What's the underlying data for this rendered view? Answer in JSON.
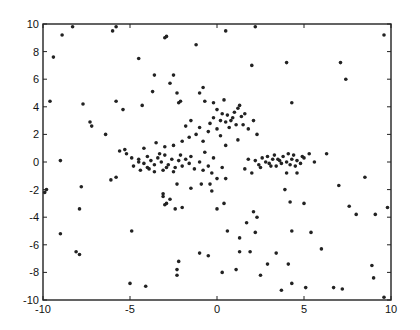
{
  "chart_data": {
    "type": "scatter",
    "title": "",
    "xlabel": "",
    "ylabel": "",
    "xlim": [
      -10,
      10
    ],
    "ylim": [
      -10,
      10
    ],
    "grid": false,
    "legend": null,
    "xticks": [
      -10,
      -5,
      0,
      5,
      10
    ],
    "yticks": [
      -10,
      -8,
      -6,
      -4,
      -2,
      0,
      2,
      4,
      6,
      8,
      10
    ],
    "xtick_labels": [
      "-10",
      "-5",
      "0",
      "5",
      "10"
    ],
    "ytick_labels": [
      "-10",
      "-8",
      "-6",
      "-4",
      "-2",
      "0",
      "2",
      "4",
      "6",
      "8",
      "10"
    ],
    "marker_color": "#222222",
    "series": [
      {
        "name": "points",
        "points": [
          [
            -8.9,
            9.2
          ],
          [
            -8.3,
            9.8
          ],
          [
            -5.8,
            9.8
          ],
          [
            -6.0,
            9.5
          ],
          [
            -3.0,
            9.0
          ],
          [
            -2.9,
            9.1
          ],
          [
            -1.2,
            8.5
          ],
          [
            2.2,
            9.8
          ],
          [
            9.6,
            9.2
          ],
          [
            -9.4,
            7.6
          ],
          [
            -4.5,
            7.5
          ],
          [
            -3.6,
            6.3
          ],
          [
            -2.7,
            5.7
          ],
          [
            -2.5,
            6.3
          ],
          [
            -2.3,
            5.0
          ],
          [
            -2.2,
            4.3
          ],
          [
            -2.1,
            4.4
          ],
          [
            -3.7,
            5.1
          ],
          [
            -4.3,
            4.1
          ],
          [
            -0.8,
            5.4
          ],
          [
            -0.7,
            4.4
          ],
          [
            0.5,
            9.5
          ],
          [
            2.0,
            7.0
          ],
          [
            4.0,
            7.2
          ],
          [
            7.1,
            7.2
          ],
          [
            7.4,
            6.0
          ],
          [
            4.3,
            4.3
          ],
          [
            -1.0,
            5.0
          ],
          [
            -9.6,
            4.4
          ],
          [
            -7.7,
            4.2
          ],
          [
            -5.8,
            4.4
          ],
          [
            -5.4,
            3.8
          ],
          [
            -7.3,
            2.9
          ],
          [
            -7.2,
            2.6
          ],
          [
            -6.4,
            2.0
          ],
          [
            -9.0,
            0.1
          ],
          [
            -9.8,
            -2.0
          ],
          [
            -9.9,
            -2.2
          ],
          [
            0.0,
            3.8
          ],
          [
            0.3,
            3.5
          ],
          [
            0.6,
            3.4
          ],
          [
            0.8,
            3.0
          ],
          [
            1.0,
            3.6
          ],
          [
            1.2,
            3.9
          ],
          [
            1.4,
            3.3
          ],
          [
            0.9,
            3.2
          ],
          [
            0.5,
            2.9
          ],
          [
            0.2,
            3.0
          ],
          [
            -0.2,
            3.2
          ],
          [
            -0.4,
            2.8
          ],
          [
            1.6,
            3.5
          ],
          [
            1.1,
            2.7
          ],
          [
            0.7,
            2.5
          ],
          [
            -0.5,
            2.2
          ],
          [
            -1.0,
            2.5
          ],
          [
            -1.2,
            2.0
          ],
          [
            -1.6,
            1.8
          ],
          [
            -2.0,
            1.5
          ],
          [
            -2.5,
            1.2
          ],
          [
            -3.0,
            1.1
          ],
          [
            -3.5,
            1.4
          ],
          [
            -4.2,
            1.0
          ],
          [
            -0.8,
            1.5
          ],
          [
            0.2,
            1.9
          ],
          [
            0.5,
            1.2
          ],
          [
            1.2,
            1.6
          ],
          [
            1.8,
            2.4
          ],
          [
            2.1,
            3.0
          ],
          [
            -0.2,
            4.3
          ],
          [
            0.4,
            4.5
          ],
          [
            1.3,
            4.1
          ],
          [
            2.3,
            2.0
          ],
          [
            -1.5,
            3.0
          ],
          [
            -1.8,
            2.6
          ],
          [
            1.5,
            2.7
          ],
          [
            0.0,
            2.4
          ],
          [
            -5.3,
            0.9
          ],
          [
            -5.2,
            0.6
          ],
          [
            -4.9,
            0.3
          ],
          [
            -4.8,
            -0.3
          ],
          [
            -4.5,
            0.2
          ],
          [
            -4.2,
            -0.1
          ],
          [
            -4.0,
            0.4
          ],
          [
            -3.8,
            0.1
          ],
          [
            -3.6,
            -0.2
          ],
          [
            -3.4,
            0.3
          ],
          [
            -3.2,
            0.0
          ],
          [
            -3.0,
            0.5
          ],
          [
            -2.8,
            -0.2
          ],
          [
            -2.6,
            0.2
          ],
          [
            -2.4,
            -0.4
          ],
          [
            -2.2,
            0.1
          ],
          [
            -2.0,
            -0.3
          ],
          [
            -1.8,
            0.2
          ],
          [
            -1.6,
            -0.1
          ],
          [
            -1.3,
            -0.5
          ],
          [
            -1.0,
            0.0
          ],
          [
            -0.8,
            -0.6
          ],
          [
            -0.5,
            -0.3
          ],
          [
            -0.3,
            -0.8
          ],
          [
            0.0,
            -1.2
          ],
          [
            -3.9,
            -0.5
          ],
          [
            -3.6,
            -0.7
          ],
          [
            -4.4,
            -0.6
          ],
          [
            -5.6,
            0.8
          ],
          [
            -3.1,
            -0.6
          ],
          [
            -2.9,
            -0.4
          ],
          [
            -2.5,
            -0.7
          ],
          [
            -4.0,
            -0.4
          ],
          [
            -3.3,
            0.6
          ],
          [
            -2.1,
            0.5
          ],
          [
            -1.5,
            0.4
          ],
          [
            -0.7,
            0.7
          ],
          [
            -0.2,
            0.3
          ],
          [
            0.3,
            -0.4
          ],
          [
            -6.1,
            -1.3
          ],
          [
            -5.8,
            -1.1
          ],
          [
            -2.3,
            -1.6
          ],
          [
            -1.5,
            -1.9
          ],
          [
            -0.9,
            -1.6
          ],
          [
            -0.4,
            -1.6
          ],
          [
            -3.1,
            -2.3
          ],
          [
            -2.9,
            -3.0
          ],
          [
            -2.7,
            -2.7
          ],
          [
            -2.0,
            -3.3
          ],
          [
            0.5,
            -1.2
          ],
          [
            -4.5,
            0.0
          ],
          [
            2.2,
            0.1
          ],
          [
            2.4,
            -0.2
          ],
          [
            2.6,
            0.3
          ],
          [
            2.8,
            0.0
          ],
          [
            3.0,
            -0.1
          ],
          [
            3.2,
            0.2
          ],
          [
            3.4,
            -0.3
          ],
          [
            3.6,
            0.1
          ],
          [
            3.8,
            0.4
          ],
          [
            4.0,
            0.0
          ],
          [
            4.2,
            -0.2
          ],
          [
            4.4,
            0.5
          ],
          [
            4.6,
            0.1
          ],
          [
            4.8,
            -0.1
          ],
          [
            5.0,
            0.3
          ],
          [
            2.5,
            -0.4
          ],
          [
            2.9,
            0.4
          ],
          [
            3.3,
            0.5
          ],
          [
            3.7,
            -0.1
          ],
          [
            4.1,
            0.6
          ],
          [
            4.5,
            -0.3
          ],
          [
            3.1,
            -0.3
          ],
          [
            3.5,
            0.2
          ],
          [
            4.3,
            0.2
          ],
          [
            4.9,
            0.4
          ],
          [
            1.8,
            0.2
          ],
          [
            1.6,
            -0.5
          ],
          [
            2.0,
            -0.8
          ],
          [
            5.3,
            0.6
          ],
          [
            5.6,
            0.0
          ],
          [
            6.3,
            0.6
          ],
          [
            4.0,
            -0.8
          ],
          [
            4.6,
            -0.8
          ],
          [
            8.5,
            -1.1
          ],
          [
            4.2,
            -2.9
          ],
          [
            5.0,
            -3.0
          ],
          [
            2.1,
            -3.6
          ],
          [
            -0.3,
            -2.1
          ],
          [
            -7.8,
            -1.8
          ],
          [
            -7.9,
            -3.4
          ],
          [
            -9.0,
            -5.2
          ],
          [
            -4.9,
            -5.0
          ],
          [
            -3.1,
            -2.5
          ],
          [
            -3.0,
            -3.1
          ],
          [
            -2.4,
            -3.4
          ],
          [
            -5.0,
            -8.8
          ],
          [
            -2.3,
            -7.8
          ],
          [
            1.3,
            -5.5
          ],
          [
            -1.0,
            -6.6
          ],
          [
            -2.3,
            -8.2
          ],
          [
            0.0,
            -3.4
          ],
          [
            0.4,
            -3.0
          ],
          [
            1.7,
            -4.4
          ],
          [
            2.3,
            -4.0
          ],
          [
            3.9,
            -2.0
          ],
          [
            7.0,
            -1.7
          ],
          [
            7.6,
            -3.2
          ],
          [
            8.0,
            -3.8
          ],
          [
            9.1,
            -3.8
          ],
          [
            9.8,
            -3.3
          ],
          [
            0.6,
            -5.0
          ],
          [
            2.2,
            -5.1
          ],
          [
            2.9,
            -7.4
          ],
          [
            1.9,
            -6.5
          ],
          [
            3.4,
            -6.6
          ],
          [
            4.3,
            -5.0
          ],
          [
            5.4,
            -5.1
          ],
          [
            6.0,
            -6.3
          ],
          [
            6.7,
            -9.1
          ],
          [
            5.1,
            -9.1
          ],
          [
            4.1,
            -7.4
          ],
          [
            4.3,
            -8.8
          ],
          [
            7.2,
            -9.2
          ],
          [
            9.0,
            -8.4
          ],
          [
            8.9,
            -7.5
          ],
          [
            9.6,
            -9.8
          ],
          [
            -8.1,
            -6.5
          ],
          [
            -7.9,
            -6.7
          ],
          [
            -4.1,
            -9.0
          ],
          [
            -2.2,
            -7.2
          ],
          [
            -0.5,
            -6.8
          ],
          [
            0.3,
            -8.0
          ],
          [
            1.3,
            -6.5
          ],
          [
            1.1,
            -7.8
          ],
          [
            3.7,
            -9.3
          ],
          [
            2.5,
            -8.2
          ]
        ]
      }
    ]
  }
}
